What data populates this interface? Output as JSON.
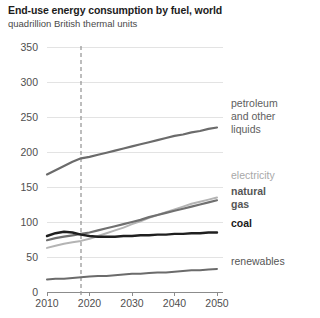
{
  "chart_data": {
    "type": "line",
    "title": "End-use energy consumption by fuel, world",
    "subtitle": "quadrillion British thermal units",
    "xlabel": "",
    "ylabel": "",
    "xlim": [
      2010,
      2050
    ],
    "ylim": [
      0,
      350
    ],
    "grid": true,
    "legend_position": "right-inline",
    "x_ticks": [
      "2010",
      "2020",
      "2030",
      "2040",
      "2050"
    ],
    "y_ticks": [
      "0",
      "50",
      "100",
      "150",
      "200",
      "250",
      "300",
      "350"
    ],
    "annotations": [
      {
        "name": "projection-divider",
        "type": "vertical-dashed-line",
        "x": 2018
      }
    ],
    "x": [
      2010,
      2012,
      2014,
      2016,
      2018,
      2020,
      2022,
      2024,
      2026,
      2028,
      2030,
      2032,
      2034,
      2036,
      2038,
      2040,
      2042,
      2044,
      2046,
      2048,
      2050
    ],
    "series": [
      {
        "name": "petroleum and other liquids",
        "label": "petroleum\nand other\nliquids",
        "color": "#6b6b6b",
        "width": 2.2,
        "values": [
          168,
          174,
          180,
          186,
          191,
          193,
          196,
          199,
          202,
          205,
          208,
          211,
          214,
          217,
          220,
          223,
          225,
          228,
          230,
          233,
          235
        ]
      },
      {
        "name": "electricity",
        "label": "electricity",
        "color": "#b4b4b4",
        "width": 2.0,
        "values": [
          63,
          66,
          69,
          71,
          73,
          76,
          80,
          84,
          88,
          92,
          97,
          101,
          106,
          110,
          114,
          118,
          122,
          126,
          129,
          132,
          135
        ]
      },
      {
        "name": "natural gas",
        "label": "natural\ngas",
        "color": "#707070",
        "width": 2.2,
        "values": [
          74,
          77,
          79,
          81,
          83,
          85,
          88,
          91,
          94,
          97,
          100,
          103,
          107,
          110,
          113,
          116,
          119,
          122,
          125,
          128,
          131
        ]
      },
      {
        "name": "coal",
        "label": "coal",
        "color": "#1f1f1f",
        "width": 2.4,
        "values": [
          80,
          84,
          86,
          85,
          82,
          80,
          79,
          79,
          79,
          80,
          80,
          81,
          81,
          82,
          82,
          83,
          83,
          84,
          84,
          85,
          85
        ]
      },
      {
        "name": "renewables",
        "label": "renewables",
        "color": "#6b6b6b",
        "width": 2.0,
        "values": [
          18,
          19,
          19,
          20,
          21,
          22,
          23,
          23,
          24,
          25,
          26,
          26,
          27,
          28,
          28,
          29,
          30,
          31,
          31,
          32,
          33
        ]
      }
    ],
    "series_labels": [
      {
        "key": "petroleum",
        "lines": [
          "petroleum",
          "and other",
          "liquids"
        ]
      },
      {
        "key": "electricity",
        "lines": [
          "electricity"
        ]
      },
      {
        "key": "natural_gas",
        "lines": [
          "natural",
          "gas"
        ]
      },
      {
        "key": "coal",
        "lines": [
          "coal"
        ]
      },
      {
        "key": "renewables",
        "lines": [
          "renewables"
        ]
      }
    ]
  },
  "colors": {
    "petroleum": "#6b6b6b",
    "electricity": "#b4b4b4",
    "natural_gas": "#707070",
    "coal": "#1f1f1f",
    "renewables": "#6b6b6b",
    "grid": "#e3e3e3",
    "axis": "#8c8c8c",
    "background": "#ffffff"
  }
}
